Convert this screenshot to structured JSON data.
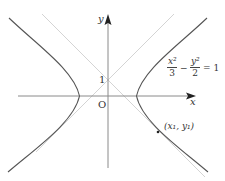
{
  "diagram": {
    "type": "hyperbola-plot",
    "axes": {
      "x_label": "x",
      "y_label": "y",
      "origin_label": "O",
      "y_tick_label": "1"
    },
    "equation": {
      "term1_num": "x²",
      "term1_den": "3",
      "minus": "−",
      "term2_num": "y²",
      "term2_den": "2",
      "rhs": "= 1"
    },
    "point_label": "(x₁,  y₁)",
    "lines": [
      "y = x + 1",
      "y = −x + 1"
    ],
    "colors": {
      "curve": "#555555",
      "axis": "#888888",
      "lines": "#d0d0d0"
    }
  }
}
